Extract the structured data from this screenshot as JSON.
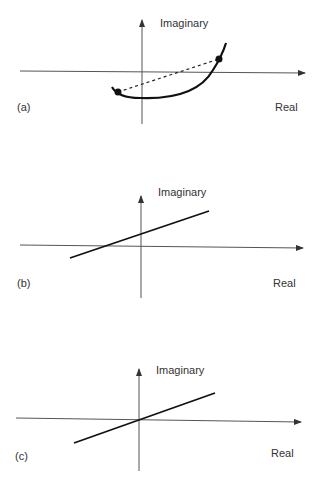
{
  "figure": {
    "panels": [
      {
        "id": "a",
        "tag": "(a)",
        "y_axis_label": "Imaginary",
        "x_axis_label": "Real",
        "description": "Curved locus crossing real axis with two endpoint dots joined by a dashed chord"
      },
      {
        "id": "b",
        "tag": "(b)",
        "y_axis_label": "Imaginary",
        "x_axis_label": "Real",
        "description": "Straight line with positive slope crossing imaginary axis above origin"
      },
      {
        "id": "c",
        "tag": "(c)",
        "y_axis_label": "Imaginary",
        "x_axis_label": "Real",
        "description": "Straight line with positive slope passing through origin"
      }
    ]
  },
  "colors": {
    "axis": "#555555",
    "curve": "#111111",
    "text": "#333333"
  }
}
